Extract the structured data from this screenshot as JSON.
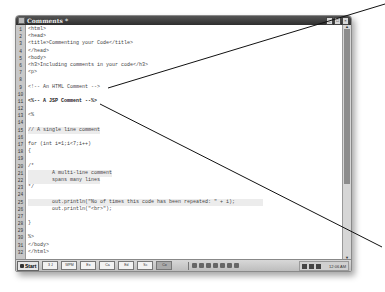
{
  "window": {
    "title": "Comments *",
    "controls": {
      "minimize": "_",
      "maximize": "□",
      "close": "×"
    }
  },
  "editor": {
    "lines": [
      {
        "n": "1",
        "text": "<html>"
      },
      {
        "n": "2",
        "text": "<head>"
      },
      {
        "n": "3",
        "text": "<title>Commenting your Code</title>"
      },
      {
        "n": "4",
        "text": "</head>"
      },
      {
        "n": "5",
        "text": "<body>"
      },
      {
        "n": "6",
        "text": "<h3>Including comments in your code</h3>"
      },
      {
        "n": "7",
        "text": "<p>"
      },
      {
        "n": "8",
        "text": ""
      },
      {
        "n": "9",
        "text": "<!-- An HTML Comment -->"
      },
      {
        "n": "10",
        "text": ""
      },
      {
        "n": "11",
        "text": "<%-- A JSP Comment --%>"
      },
      {
        "n": "12",
        "text": ""
      },
      {
        "n": "13",
        "text": "<%"
      },
      {
        "n": "14",
        "text": ""
      },
      {
        "n": "15",
        "text": "// A single line comment"
      },
      {
        "n": "16",
        "text": ""
      },
      {
        "n": "17",
        "text": "for (int i=1;i<7;i++)"
      },
      {
        "n": "18",
        "text": "{"
      },
      {
        "n": "19",
        "text": ""
      },
      {
        "n": "20",
        "text": "/*"
      },
      {
        "n": "21",
        "text": "        A multi-line comment"
      },
      {
        "n": "22",
        "text": "        spans many lines"
      },
      {
        "n": "23",
        "text": "*/"
      },
      {
        "n": "24",
        "text": ""
      },
      {
        "n": "25",
        "text": "        out.println(\"No of times this code has been repeated: \" + i);"
      },
      {
        "n": "26",
        "text": "        out.println(\"<br>\");"
      },
      {
        "n": "27",
        "text": ""
      },
      {
        "n": "28",
        "text": "}"
      },
      {
        "n": "29",
        "text": ""
      },
      {
        "n": "30",
        "text": "%>"
      },
      {
        "n": "31",
        "text": "</body>"
      },
      {
        "n": "32",
        "text": "</html>"
      }
    ]
  },
  "taskbar": {
    "start_label": "Start",
    "task_buttons": [
      "3 J",
      "WPM",
      "Ex",
      "Ca",
      "Ed",
      "Sc",
      "Co"
    ],
    "clock": "12:06 AM"
  },
  "colors": {
    "titlebar": "#3a3a3a",
    "gutter": "#c8c8c8",
    "highlight": "#ececec",
    "callout_line": "#111111"
  }
}
